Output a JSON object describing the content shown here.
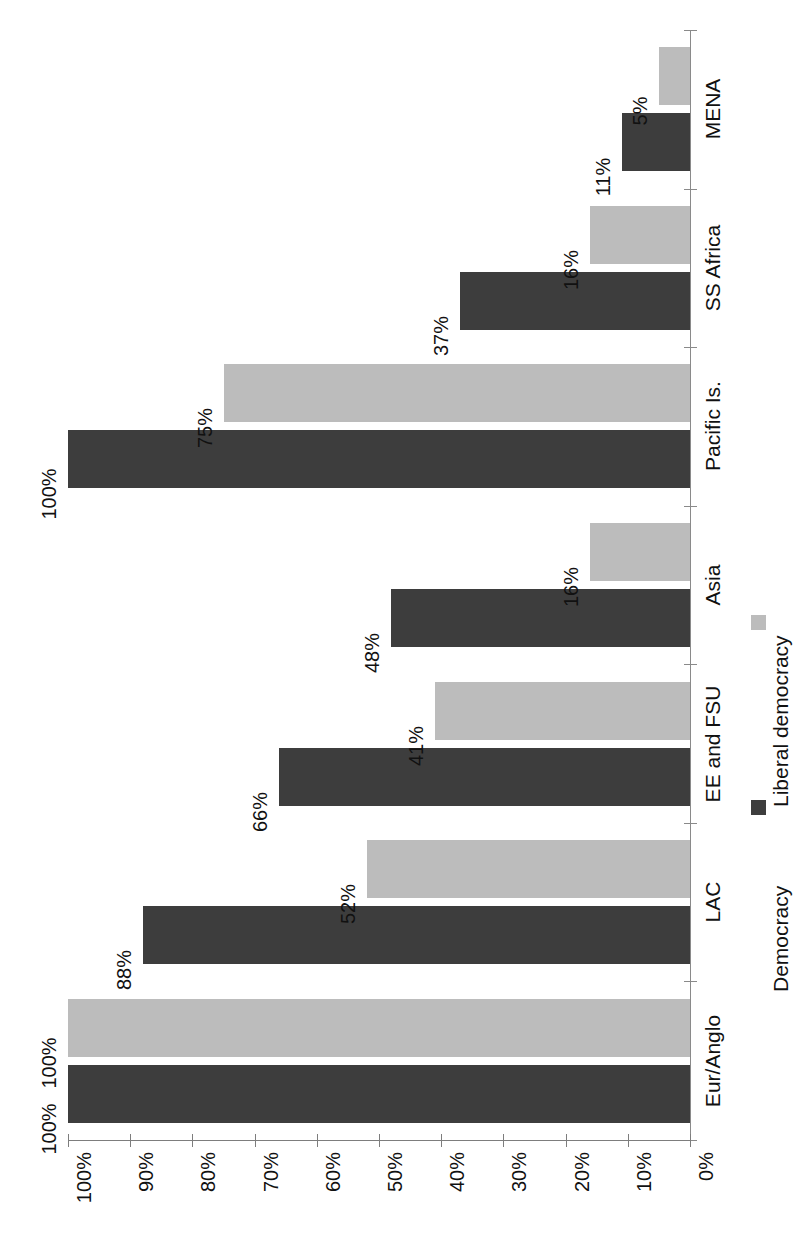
{
  "chart_data": {
    "type": "bar",
    "orientation": "horizontal",
    "rotated_90": true,
    "title": "",
    "subtitle": "",
    "xlabel": "",
    "ylabel": "",
    "grid": false,
    "legend_position": "right",
    "categories": [
      "Eur/Anglo",
      "LAC",
      "EE and FSU",
      "Asia",
      "Pacific Is.",
      "SS Africa",
      "MENA"
    ],
    "axis": {
      "min": 0,
      "max": 100,
      "step": 10,
      "unit": "%",
      "ticks": [
        100,
        90,
        80,
        70,
        60,
        50,
        40,
        30,
        20,
        10,
        0
      ],
      "tick_labels": [
        "100%",
        "90%",
        "80%",
        "70%",
        "60%",
        "50%",
        "40%",
        "30%",
        "20%",
        "10%",
        "0%"
      ]
    },
    "series": [
      {
        "name": "Democracy",
        "color": "#3d3d3d",
        "values": [
          100,
          88,
          66,
          48,
          100,
          37,
          11
        ],
        "value_labels": [
          "100%",
          "88%",
          "66%",
          "48%",
          "100%",
          "37%",
          "11%"
        ]
      },
      {
        "name": "Liberal democracy",
        "color": "#bcbcbc",
        "values": [
          100,
          52,
          41,
          16,
          75,
          16,
          5
        ],
        "value_labels": [
          "100%",
          "52%",
          "41%",
          "16%",
          "75%",
          "16%",
          "5%"
        ]
      }
    ]
  },
  "legend": {
    "items": [
      {
        "label": "Democracy",
        "color": "#3d3d3d"
      },
      {
        "label": "Liberal democracy",
        "color": "#bcbcbc"
      }
    ]
  },
  "colors": {
    "democracy": "#3d3d3d",
    "liberal_democracy": "#bcbcbc",
    "axis": "#7d7d7d",
    "text": "#111111",
    "background": "#ffffff"
  }
}
